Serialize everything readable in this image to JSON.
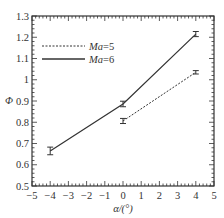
{
  "chart_data": {
    "type": "line",
    "title": "",
    "xlabel": "α/(°)",
    "ylabel": "Φ",
    "xlim": [
      -5,
      5
    ],
    "ylim": [
      0.5,
      1.3
    ],
    "xticks": [
      -5,
      -4,
      -3,
      -2,
      -1,
      0,
      1,
      2,
      3,
      4,
      5
    ],
    "yticks": [
      0.5,
      0.6,
      0.7,
      0.8,
      0.9,
      1,
      1.1,
      1.2,
      1.3
    ],
    "xtick_labels": [
      "−5",
      "−4",
      "−3",
      "−2",
      "−1",
      "0",
      "1",
      "2",
      "3",
      "4",
      "5"
    ],
    "ytick_labels": [
      "0.5",
      "0.6",
      "0.7",
      "0.8",
      "0.9",
      "1",
      "1.1",
      "1.2",
      "1.3"
    ],
    "grid": false,
    "legend_position": "upper left",
    "series": [
      {
        "name": "Ma=5",
        "legend_prefix": "Ma",
        "legend_suffix": "=5",
        "style": "dashed",
        "color": "#333333",
        "x": [
          0,
          4
        ],
        "y": [
          0.806,
          1.035
        ],
        "err": [
          0.012,
          0.008
        ]
      },
      {
        "name": "Ma=6",
        "legend_prefix": "Ma",
        "legend_suffix": "=6",
        "style": "solid",
        "color": "#333333",
        "x": [
          -4,
          0,
          4
        ],
        "y": [
          0.665,
          0.886,
          1.215
        ],
        "err": [
          0.018,
          0.013,
          0.012
        ]
      }
    ]
  }
}
